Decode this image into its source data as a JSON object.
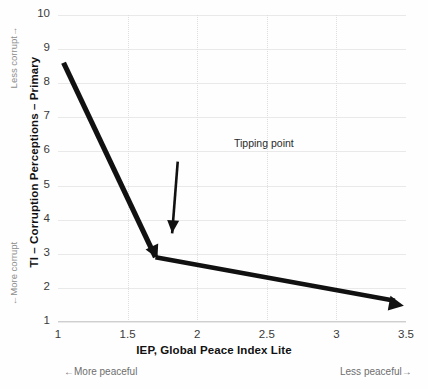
{
  "chart_data": {
    "type": "line",
    "title": "",
    "subtitle": "",
    "xlabel": "IEP, Global Peace Index Lite",
    "ylabel": "TI – Corruption Perceptions – Primary",
    "xlim": [
      1,
      3.5
    ],
    "ylim": [
      1,
      10
    ],
    "xticks": [
      "1",
      "1.5",
      "2",
      "2.5",
      "3",
      "3.5"
    ],
    "xtick_values": [
      1,
      1.5,
      2,
      2.5,
      3,
      3.5
    ],
    "yticks": [
      "1",
      "2",
      "3",
      "4",
      "5",
      "6",
      "7",
      "8",
      "9",
      "10"
    ],
    "ytick_values": [
      1,
      2,
      3,
      4,
      5,
      6,
      7,
      8,
      9,
      10
    ],
    "grid": "horizontal solid light-gray; vertical dotted light-gray",
    "legend": "none",
    "series": [
      {
        "name": "Corruption vs Peace trajectory",
        "style": "thick black arrow polyline",
        "color": "#111111",
        "points": [
          {
            "x": 1.04,
            "y": 8.6
          },
          {
            "x": 1.7,
            "y": 2.9
          },
          {
            "x": 3.42,
            "y": 1.62
          }
        ],
        "arrow_heads": [
          "mid-vertex-down",
          "end-right"
        ]
      }
    ],
    "annotations": [
      {
        "text": "Tipping point",
        "text_x": 1.97,
        "text_y": 6.0,
        "arrow_from": {
          "x": 1.86,
          "y": 5.7
        },
        "arrow_to": {
          "x": 1.82,
          "y": 3.6
        },
        "color": "#111111"
      },
      {
        "text": "Less corrupt→",
        "axis": "y",
        "position": "top",
        "color": "#8d8d8d"
      },
      {
        "text": "←More corrupt",
        "axis": "y",
        "position": "bottom",
        "color": "#8d8d8d"
      },
      {
        "text": "←More peaceful",
        "axis": "x",
        "position": "left",
        "color": "#6e6e6e"
      },
      {
        "text": "Less peaceful→",
        "axis": "x",
        "position": "right",
        "color": "#6e6e6e"
      }
    ],
    "colors": {
      "background": "#fefefe",
      "line": "#111111",
      "hgrid": "#e9e9e9",
      "vgrid": "#dedede",
      "tick_text": "#3a3a3a",
      "axis_title": "#111111"
    }
  },
  "axis": {
    "x_title": "IEP, Global Peace Index Lite",
    "y_title": "TI – Corruption Perceptions – Primary"
  },
  "notes": {
    "y_top": "Less corrupt→",
    "y_bottom": "←More corrupt",
    "x_left": "←More peaceful",
    "x_right": "Less peaceful→"
  },
  "annotation": {
    "tipping_point": "Tipping point"
  }
}
